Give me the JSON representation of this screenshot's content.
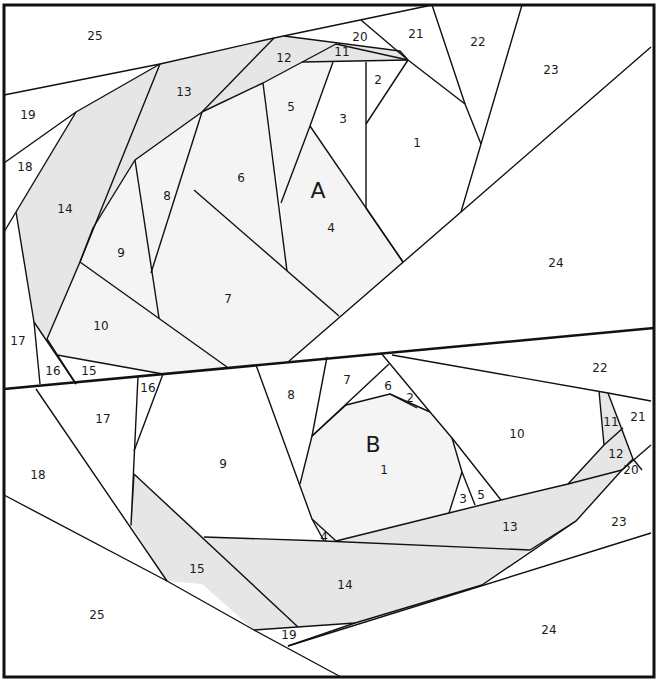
{
  "diagram": {
    "type": "foundation-paper-piecing-pattern",
    "colors": {
      "background": "#ffffff",
      "shaded": "#e6e6e6",
      "light_shaded": "#f4f4f4",
      "line": "#111111"
    },
    "blocks": [
      {
        "label": "A",
        "label_pos": [
          318,
          192
        ],
        "pieces": [
          {
            "n": "1",
            "x": 417,
            "y": 143
          },
          {
            "n": "2",
            "x": 378,
            "y": 80
          },
          {
            "n": "3",
            "x": 343,
            "y": 119
          },
          {
            "n": "4",
            "x": 331,
            "y": 228
          },
          {
            "n": "5",
            "x": 291,
            "y": 107
          },
          {
            "n": "6",
            "x": 241,
            "y": 178
          },
          {
            "n": "7",
            "x": 228,
            "y": 299
          },
          {
            "n": "8",
            "x": 167,
            "y": 196
          },
          {
            "n": "9",
            "x": 121,
            "y": 253
          },
          {
            "n": "10",
            "x": 101,
            "y": 326
          },
          {
            "n": "11",
            "x": 342,
            "y": 52
          },
          {
            "n": "12",
            "x": 284,
            "y": 58
          },
          {
            "n": "13",
            "x": 184,
            "y": 92
          },
          {
            "n": "14",
            "x": 65,
            "y": 209
          },
          {
            "n": "15",
            "x": 89,
            "y": 371
          },
          {
            "n": "16",
            "x": 53,
            "y": 371
          },
          {
            "n": "17",
            "x": 18,
            "y": 341
          },
          {
            "n": "18",
            "x": 25,
            "y": 167
          },
          {
            "n": "19",
            "x": 28,
            "y": 115
          },
          {
            "n": "20",
            "x": 360,
            "y": 37
          },
          {
            "n": "21",
            "x": 416,
            "y": 34
          },
          {
            "n": "22",
            "x": 478,
            "y": 42
          },
          {
            "n": "23",
            "x": 551,
            "y": 70
          },
          {
            "n": "24",
            "x": 556,
            "y": 263
          },
          {
            "n": "25",
            "x": 95,
            "y": 36
          }
        ]
      },
      {
        "label": "B",
        "label_pos": [
          373,
          446
        ],
        "pieces": [
          {
            "n": "1",
            "x": 384,
            "y": 470
          },
          {
            "n": "2",
            "x": 410,
            "y": 398
          },
          {
            "n": "3",
            "x": 463,
            "y": 499
          },
          {
            "n": "4",
            "x": 324,
            "y": 537
          },
          {
            "n": "5",
            "x": 481,
            "y": 495
          },
          {
            "n": "6",
            "x": 388,
            "y": 386
          },
          {
            "n": "7",
            "x": 347,
            "y": 380
          },
          {
            "n": "8",
            "x": 291,
            "y": 395
          },
          {
            "n": "9",
            "x": 223,
            "y": 464
          },
          {
            "n": "10",
            "x": 517,
            "y": 434
          },
          {
            "n": "11",
            "x": 611,
            "y": 422
          },
          {
            "n": "12",
            "x": 616,
            "y": 454
          },
          {
            "n": "13",
            "x": 510,
            "y": 527
          },
          {
            "n": "14",
            "x": 345,
            "y": 585
          },
          {
            "n": "15",
            "x": 197,
            "y": 569
          },
          {
            "n": "16",
            "x": 148,
            "y": 388
          },
          {
            "n": "17",
            "x": 103,
            "y": 419
          },
          {
            "n": "18",
            "x": 38,
            "y": 475
          },
          {
            "n": "19",
            "x": 289,
            "y": 635
          },
          {
            "n": "20",
            "x": 631,
            "y": 470
          },
          {
            "n": "21",
            "x": 638,
            "y": 417
          },
          {
            "n": "22",
            "x": 600,
            "y": 368
          },
          {
            "n": "23",
            "x": 619,
            "y": 522
          },
          {
            "n": "24",
            "x": 549,
            "y": 630
          },
          {
            "n": "25",
            "x": 97,
            "y": 615
          }
        ]
      }
    ]
  }
}
